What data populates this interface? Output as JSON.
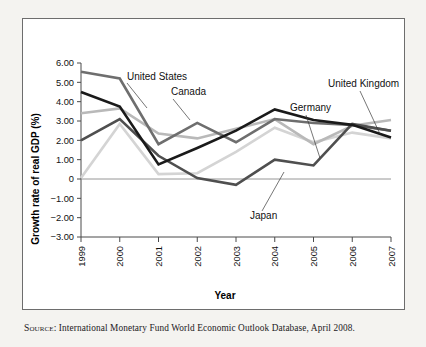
{
  "figure": {
    "source_prefix": "Source:",
    "source_text": " International Monetary Fund World Economic Outlook Database, April 2008."
  },
  "chart_data": {
    "type": "line",
    "title": "",
    "xlabel": "Year",
    "ylabel": "Growth rate of real GDP (%)",
    "categories": [
      "1999",
      "2000",
      "2001",
      "2002",
      "2003",
      "2004",
      "2005",
      "2006",
      "2007"
    ],
    "x": [
      1999,
      2000,
      2001,
      2002,
      2003,
      2004,
      2005,
      2006,
      2007
    ],
    "ylim": [
      -3.0,
      6.0
    ],
    "ytick_labels": [
      "6.00",
      "5.00",
      "4.00",
      "3.00",
      "2.00",
      "1.00",
      "0",
      "-1.00",
      "-2.00",
      "-3.00"
    ],
    "ytick_values": [
      6,
      5,
      4,
      3,
      2,
      1,
      0,
      -1,
      -2,
      -3
    ],
    "grid": false,
    "zero_line": true,
    "legend_position": "inline-labels",
    "series": [
      {
        "name": "Canada",
        "color": "#6e6e6e",
        "values": [
          5.55,
          5.2,
          1.8,
          2.9,
          1.9,
          3.1,
          2.9,
          2.8,
          2.5
        ]
      },
      {
        "name": "United States",
        "color": "#1a1a1a",
        "values": [
          4.5,
          3.75,
          0.75,
          1.6,
          2.5,
          3.6,
          3.05,
          2.8,
          2.15
        ]
      },
      {
        "name": "United Kingdom",
        "color": "#b9b9b9",
        "values": [
          3.4,
          3.65,
          2.35,
          2.1,
          2.6,
          3.1,
          1.8,
          2.75,
          3.05
        ]
      },
      {
        "name": "Germany",
        "color": "#4f4f4f",
        "values": [
          2.0,
          3.1,
          1.2,
          0.05,
          -0.3,
          1.0,
          0.7,
          2.85,
          2.5
        ]
      },
      {
        "name": "Japan",
        "color": "#d4d4d4",
        "values": [
          0.05,
          2.85,
          0.25,
          0.3,
          1.4,
          2.65,
          1.9,
          2.4,
          2.1
        ]
      }
    ],
    "annotations": [
      {
        "text": "United States",
        "label_x": 104,
        "label_y": 61,
        "leader_from": [
          104,
          64
        ],
        "leader_to": [
          124,
          89
        ]
      },
      {
        "text": "Canada",
        "label_x": 148,
        "label_y": 76,
        "leader_from": [
          150,
          80
        ],
        "leader_to": [
          167,
          101
        ]
      },
      {
        "text": "Germany",
        "label_x": 267,
        "label_y": 92,
        "leader_from": [
          283,
          96
        ],
        "leader_to": [
          297,
          139
        ]
      },
      {
        "text": "United Kingdom",
        "label_x": 305,
        "label_y": 68,
        "leader_from": [
          337,
          72
        ],
        "leader_to": [
          357,
          115
        ]
      },
      {
        "text": "Japan",
        "label_x": 227,
        "label_y": 200,
        "leader_from": [
          239,
          192
        ],
        "leader_to": [
          261,
          153
        ]
      }
    ]
  }
}
